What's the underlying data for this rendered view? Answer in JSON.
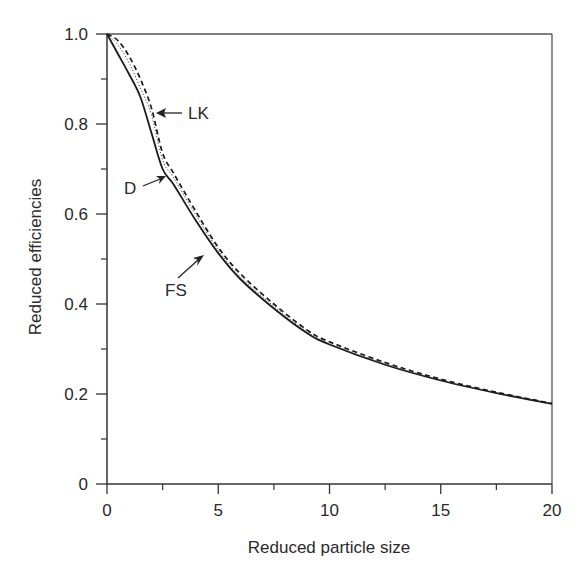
{
  "chart_data": {
    "type": "line",
    "title": "",
    "xlabel": "Reduced particle size",
    "ylabel": "Reduced efficiencies",
    "xlim": [
      0,
      20
    ],
    "ylim": [
      0,
      1.0
    ],
    "xticks": [
      0,
      5,
      10,
      15,
      20
    ],
    "xtick_labels": [
      "0",
      "5",
      "10",
      "15",
      "20"
    ],
    "x_minor_ticks": [
      2.5,
      7.5,
      12.5,
      17.5
    ],
    "yticks": [
      0,
      0.2,
      0.4,
      0.6,
      0.8,
      1.0
    ],
    "ytick_labels": [
      "0",
      "0.2",
      "0.4",
      "0.6",
      "0.8",
      "1.0"
    ],
    "y_minor_ticks": [
      0.1,
      0.3,
      0.5,
      0.7,
      0.9
    ],
    "grid": false,
    "legend": "none (curves labeled with arrow annotations)",
    "x": [
      0,
      0.5,
      1,
      1.5,
      2,
      2.5,
      3,
      4,
      5,
      6,
      7.5,
      9,
      10,
      12.5,
      15,
      17.5,
      20
    ],
    "series": [
      {
        "name": "FS",
        "style": "solid",
        "values": [
          1.0,
          0.955,
          0.91,
          0.86,
          0.78,
          0.7,
          0.665,
          0.585,
          0.513,
          0.455,
          0.39,
          0.335,
          0.31,
          0.265,
          0.23,
          0.202,
          0.178
        ]
      },
      {
        "name": "D",
        "style": "dotted",
        "values": [
          1.0,
          0.975,
          0.935,
          0.88,
          0.82,
          0.72,
          0.68,
          0.597,
          0.52,
          0.46,
          0.395,
          0.338,
          0.312,
          0.267,
          0.231,
          0.203,
          0.178
        ]
      },
      {
        "name": "LK",
        "style": "dashed",
        "values": [
          1.0,
          0.985,
          0.95,
          0.9,
          0.835,
          0.735,
          0.69,
          0.605,
          0.526,
          0.467,
          0.4,
          0.342,
          0.316,
          0.27,
          0.233,
          0.204,
          0.179
        ]
      }
    ],
    "annotations": [
      {
        "text": "LK",
        "target": "LK"
      },
      {
        "text": "D",
        "target": "FS"
      },
      {
        "text": "FS",
        "target": "FS"
      }
    ]
  }
}
